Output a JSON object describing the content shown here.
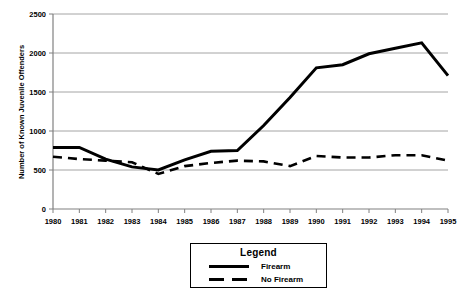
{
  "chart_data": {
    "type": "line",
    "title": "",
    "xlabel": "",
    "ylabel": "Number of Known Juvenile Offenders",
    "x": [
      1980,
      1981,
      1982,
      1983,
      1984,
      1985,
      1986,
      1987,
      1988,
      1989,
      1990,
      1991,
      1992,
      1993,
      1994,
      1995
    ],
    "categories": [
      "1980",
      "1981",
      "1982",
      "1983",
      "1984",
      "1985",
      "1986",
      "1987",
      "1988",
      "1989",
      "1990",
      "1991",
      "1992",
      "1993",
      "1994",
      "1995"
    ],
    "series": [
      {
        "name": "Firearm",
        "style": "solid",
        "color": "#000000",
        "values": [
          790,
          790,
          640,
          540,
          500,
          630,
          740,
          750,
          1070,
          1430,
          1810,
          1850,
          1990,
          2060,
          2130,
          1710
        ]
      },
      {
        "name": "No Firearm",
        "style": "dashed",
        "color": "#000000",
        "values": [
          670,
          640,
          620,
          600,
          450,
          550,
          590,
          620,
          610,
          550,
          680,
          660,
          660,
          690,
          690,
          620
        ]
      }
    ],
    "ylim": [
      0,
      2500
    ],
    "yticks": [
      0,
      500,
      1000,
      1500,
      2000,
      2500
    ],
    "ytick_labels": [
      "0",
      "500",
      "1000",
      "1500",
      "2000",
      "2500"
    ],
    "xlim": [
      1980,
      1995
    ],
    "grid": "horizontal",
    "legend_position": "below-center"
  },
  "legend": {
    "title": "Legend",
    "entries": [
      {
        "label": "Firearm",
        "style": "solid"
      },
      {
        "label": "No Firearm",
        "style": "dashed"
      }
    ]
  }
}
